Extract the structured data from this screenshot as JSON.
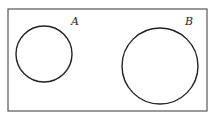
{
  "diagram": {
    "type": "venn",
    "universe": {
      "x": 8,
      "y": 9,
      "width": 199,
      "height": 102
    },
    "sets": [
      {
        "label": "A",
        "cx": 44,
        "cy": 54,
        "r": 28,
        "label_x": 71,
        "label_y": 25
      },
      {
        "label": "B",
        "cx": 160,
        "cy": 66,
        "r": 38,
        "label_x": 185,
        "label_y": 25
      }
    ],
    "relationship": "disjoint",
    "stroke_color": "#222222",
    "border_color": "#555555"
  }
}
